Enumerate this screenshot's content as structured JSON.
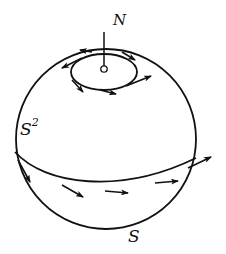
{
  "figure": {
    "labels": {
      "north_pole": "N",
      "sphere": "S",
      "sphere_exponent": "2",
      "south_pole": "S"
    },
    "colors": {
      "ink": "#111111",
      "background": "#ffffff"
    },
    "elements": {
      "sphere": "circle outline",
      "polar_circle": "small circle around north pole with tangent vector arrows",
      "equator": "great circle with tangent vector arrows",
      "pole_marker": "small open circle at north pole with vertical stem"
    }
  }
}
